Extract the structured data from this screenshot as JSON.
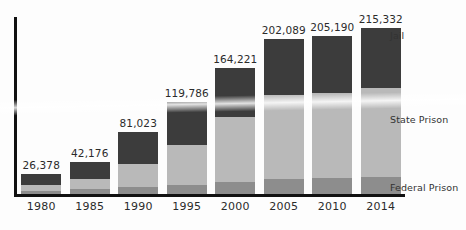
{
  "chart_data": {
    "type": "bar",
    "stacked": true,
    "title": "",
    "subtitle": "",
    "xlabel": "",
    "ylabel": "",
    "grid": false,
    "legend_position": "right-inline",
    "categories": [
      "1980",
      "1985",
      "1990",
      "1995",
      "2000",
      "2005",
      "2010",
      "2014"
    ],
    "totals": [
      26378,
      42176,
      81023,
      119786,
      164221,
      202089,
      205190,
      215332
    ],
    "total_labels": [
      "26,378",
      "42,176",
      "81,023",
      "119,786",
      "164,221",
      "202,089",
      "205,190",
      "215,332"
    ],
    "series": [
      {
        "name": "Federal Prison",
        "color": "#8d8d8d",
        "values": [
          4500,
          6000,
          9000,
          12000,
          16000,
          19500,
          20500,
          22000
        ]
      },
      {
        "name": "State Prison",
        "color": "#b9b9b9",
        "values": [
          7000,
          13000,
          30000,
          52000,
          84000,
          109000,
          111000,
          116000
        ]
      },
      {
        "name": "Jail",
        "color": "#3c3c3c",
        "values": [
          14878,
          23176,
          42023,
          55786,
          64221,
          73589,
          73690,
          77332
        ]
      }
    ],
    "ylim": [
      0,
      230000
    ],
    "axis_color": "#111111"
  },
  "axis": {
    "x_tick_labels": [
      "1980",
      "1985",
      "1990",
      "1995",
      "2000",
      "2005",
      "2010",
      "2014"
    ]
  },
  "series_labels": {
    "jail": "Jail",
    "state_prison": "State Prison",
    "federal_prison": "Federal Prison"
  },
  "bar_values": {
    "y1980": "26,378",
    "y1985": "42,176",
    "y1990": "81,023",
    "y1995": "119,786",
    "y2000": "164,221",
    "y2005": "202,089",
    "y2010": "205,190",
    "y2014": "215,332"
  },
  "colors": {
    "jail": "#3c3c3c",
    "state_prison": "#b9b9b9",
    "federal_prison": "#8d8d8d",
    "axis": "#111111",
    "text": "#2b2b2b",
    "background": "#fdfdfd"
  }
}
